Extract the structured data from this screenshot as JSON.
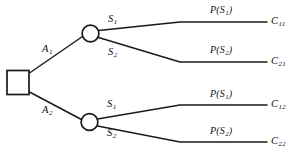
{
  "diagram": {
    "type": "decision-tree",
    "title": "",
    "nodes": {
      "decision_node": {
        "shape": "square",
        "label": ""
      },
      "chance_node_top": {
        "shape": "circle",
        "label": ""
      },
      "chance_node_bottom": {
        "shape": "circle",
        "label": ""
      }
    },
    "actions": [
      {
        "id": "A1",
        "label": "A",
        "subscript": "1"
      },
      {
        "id": "A2",
        "label": "A",
        "subscript": "2"
      }
    ],
    "states_top": [
      {
        "id": "S1_top",
        "label": "S",
        "subscript": "1"
      },
      {
        "id": "S2_top",
        "label": "S",
        "subscript": "2"
      }
    ],
    "states_bottom": [
      {
        "id": "S1_bottom",
        "label": "S",
        "subscript": "1"
      },
      {
        "id": "S2_bottom",
        "label": "S",
        "subscript": "2"
      }
    ],
    "probabilities": [
      {
        "id": "P_S1_top",
        "prefix": "P(S",
        "subscript": "1",
        "suffix": ")"
      },
      {
        "id": "P_S2_top",
        "prefix": "P(S",
        "subscript": "2",
        "suffix": ")"
      },
      {
        "id": "P_S1_bottom",
        "prefix": "P(S",
        "subscript": "1",
        "suffix": ")"
      },
      {
        "id": "P_S2_bottom",
        "prefix": "P(S",
        "subscript": "2",
        "suffix": ")"
      }
    ],
    "outcomes": [
      {
        "id": "C11",
        "label": "C",
        "subscript": "11"
      },
      {
        "id": "C21",
        "label": "C",
        "subscript": "21"
      },
      {
        "id": "C12",
        "label": "C",
        "subscript": "12"
      },
      {
        "id": "C22",
        "label": "C",
        "subscript": "22"
      }
    ],
    "colors": {
      "stroke": "#1a1a1a",
      "background": "#ffffff",
      "text": "#111111"
    }
  }
}
